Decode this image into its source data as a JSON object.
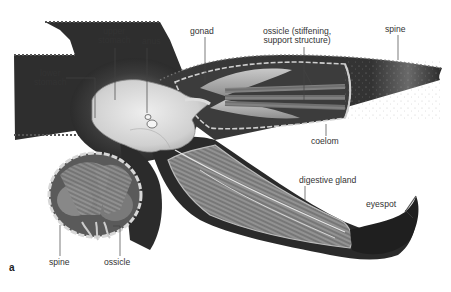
{
  "figure": {
    "panel_label": "a",
    "colors": {
      "body_dark": "#2b2b2b",
      "body_mid": "#555555",
      "stomach": "#d9d9d9",
      "gland": "#7d7d7d",
      "label_text": "#333333",
      "leader_line": "#444444"
    }
  },
  "labels": {
    "upper_stomach": "upper\nstomach",
    "upper_stomach_l1": "upper",
    "upper_stomach_l2": "stomach",
    "anus": "anus",
    "gonad": "gonad",
    "ossicle_top_l1": "ossicle (stiffening,",
    "ossicle_top_l2": "support structure)",
    "spine_top": "spine",
    "lower_stomach_l1": "lower",
    "lower_stomach_l2": "stomach",
    "coelom": "coelom",
    "digestive_gland": "digestive gland",
    "eyespot": "eyespot",
    "spine_bottom": "spine",
    "ossicle_bottom": "ossicle"
  }
}
